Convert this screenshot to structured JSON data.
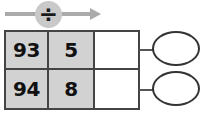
{
  "worksheet": {
    "operation": {
      "symbol": "÷",
      "icon_name": "division-symbol",
      "arrow_icon_name": "right-arrow-icon",
      "arrow_color": "#aaaaaa",
      "badge_color": "#c9c9c9"
    },
    "table": {
      "filled_cell_color": "#d2d2d2",
      "empty_cell_color": "#ffffff",
      "border_color": "#444444",
      "columns": 3,
      "rows": [
        {
          "dividend": "93",
          "divisor": "5",
          "quotient": ""
        },
        {
          "dividend": "94",
          "divisor": "8",
          "quotient": ""
        }
      ]
    },
    "answer_bubbles": [
      {
        "value": "",
        "label": "remainder-bubble-row-1"
      },
      {
        "value": "",
        "label": "remainder-bubble-row-2"
      }
    ]
  }
}
